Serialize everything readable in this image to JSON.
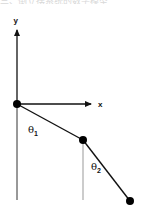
{
  "header": {
    "cut_off_text": "三、倒立摆系统的数学模型"
  },
  "diagram": {
    "axes": {
      "x_label": "x",
      "y_label": "y"
    },
    "angles": {
      "theta1": {
        "symbol": "θ",
        "subscript": "1"
      },
      "theta2": {
        "symbol": "θ",
        "subscript": "2"
      }
    },
    "nodes": [
      "origin-joint",
      "middle-joint",
      "end-mass"
    ],
    "colors": {
      "stroke": "#111111",
      "reference_line": "#999999",
      "node": "#000000"
    }
  }
}
